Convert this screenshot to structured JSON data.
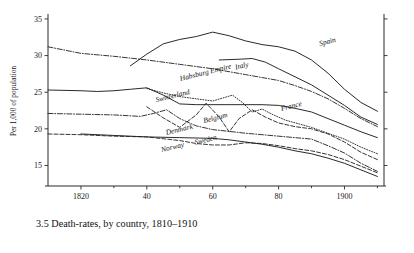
{
  "figure": {
    "caption": "3.5  Death-rates, by country, 1810–1910",
    "ylabel": "Per 1,000 of population"
  },
  "chart_data": {
    "type": "line",
    "title": "3.5  Death-rates, by country, 1810–1910",
    "xlabel": "",
    "ylabel": "Per 1,000 of population",
    "xlim": [
      1810,
      1912
    ],
    "ylim": [
      12.2,
      35.4
    ],
    "xticks": [
      1820,
      1840,
      1860,
      1880,
      1900
    ],
    "xticklabels": [
      "1820",
      "40",
      "60",
      "80",
      "1900"
    ],
    "xminorticks": [
      1830,
      1850,
      1870,
      1890,
      1910
    ],
    "yticks": [
      15,
      20,
      25,
      30,
      35
    ],
    "yticklabels": [
      "15",
      "20",
      "25",
      "30",
      "35"
    ],
    "grid": false,
    "legend_position": "inline-labels",
    "right_axis_ticks": true,
    "series": [
      {
        "name": "Spain",
        "style": "solid",
        "label_x": 1895,
        "label_y": 31.6,
        "points": [
          [
            1835,
            28.6
          ],
          [
            1840,
            30.2
          ],
          [
            1845,
            31.6
          ],
          [
            1850,
            32.2
          ],
          [
            1855,
            32.6
          ],
          [
            1860,
            33.2
          ],
          [
            1865,
            32.7
          ],
          [
            1870,
            32.0
          ],
          [
            1875,
            31.5
          ],
          [
            1880,
            31.2
          ],
          [
            1885,
            30.6
          ],
          [
            1890,
            29.4
          ],
          [
            1895,
            27.6
          ],
          [
            1900,
            25.4
          ],
          [
            1905,
            23.6
          ],
          [
            1910,
            22.4
          ]
        ]
      },
      {
        "name": "Italy",
        "style": "solid",
        "label_x": 1869,
        "label_y": 28.3,
        "points": [
          [
            1862,
            29.4
          ],
          [
            1868,
            29.5
          ],
          [
            1872,
            29.6
          ],
          [
            1876,
            29.1
          ],
          [
            1880,
            28.2
          ],
          [
            1885,
            27.1
          ],
          [
            1890,
            26.0
          ],
          [
            1895,
            24.6
          ],
          [
            1900,
            23.2
          ],
          [
            1905,
            21.6
          ],
          [
            1910,
            20.6
          ]
        ]
      },
      {
        "name": "Habsburg Empire",
        "style": "dashdot",
        "label_x": 1858,
        "label_y": 27.4,
        "points": [
          [
            1810,
            31.2
          ],
          [
            1820,
            30.3
          ],
          [
            1830,
            29.9
          ],
          [
            1840,
            29.4
          ],
          [
            1850,
            28.8
          ],
          [
            1860,
            28.2
          ],
          [
            1870,
            27.4
          ],
          [
            1880,
            26.6
          ],
          [
            1885,
            25.9
          ],
          [
            1890,
            25.1
          ],
          [
            1895,
            24.1
          ],
          [
            1900,
            22.8
          ],
          [
            1905,
            21.4
          ],
          [
            1910,
            20.3
          ]
        ]
      },
      {
        "name": "France",
        "style": "solid",
        "label_x": 1884,
        "label_y": 22.8,
        "points": [
          [
            1810,
            25.3
          ],
          [
            1820,
            25.2
          ],
          [
            1825,
            25.1
          ],
          [
            1830,
            25.2
          ],
          [
            1835,
            25.4
          ],
          [
            1840,
            25.6
          ],
          [
            1845,
            24.6
          ],
          [
            1850,
            23.4
          ],
          [
            1855,
            23.3
          ],
          [
            1865,
            23.3
          ],
          [
            1875,
            23.3
          ],
          [
            1880,
            23.2
          ],
          [
            1885,
            22.8
          ],
          [
            1890,
            22.3
          ],
          [
            1895,
            21.4
          ],
          [
            1900,
            20.5
          ],
          [
            1905,
            19.6
          ],
          [
            1910,
            18.8
          ]
        ]
      },
      {
        "name": "Switzerland",
        "style": "dotted",
        "label_x": 1848,
        "label_y": 24.2,
        "points": [
          [
            1840,
            25.5
          ],
          [
            1845,
            24.9
          ],
          [
            1850,
            24.4
          ],
          [
            1855,
            24.1
          ],
          [
            1860,
            23.8
          ],
          [
            1863,
            24.2
          ],
          [
            1866,
            24.6
          ],
          [
            1869,
            23.6
          ],
          [
            1872,
            22.3
          ],
          [
            1875,
            22.7
          ],
          [
            1878,
            22.0
          ],
          [
            1882,
            21.2
          ],
          [
            1886,
            20.7
          ],
          [
            1890,
            20.2
          ],
          [
            1895,
            19.4
          ],
          [
            1900,
            18.6
          ],
          [
            1905,
            17.5
          ],
          [
            1910,
            16.6
          ]
        ]
      },
      {
        "name": "Belgium",
        "style": "dashed",
        "label_x": 1861,
        "label_y": 21.2,
        "points": [
          [
            1840,
            23.0
          ],
          [
            1845,
            21.5
          ],
          [
            1850,
            20.2
          ],
          [
            1855,
            21.9
          ],
          [
            1858,
            23.5
          ],
          [
            1862,
            21.6
          ],
          [
            1865,
            19.6
          ],
          [
            1868,
            21.4
          ],
          [
            1872,
            22.6
          ],
          [
            1876,
            21.6
          ],
          [
            1880,
            20.8
          ],
          [
            1885,
            20.3
          ],
          [
            1890,
            20.0
          ],
          [
            1895,
            19.3
          ],
          [
            1900,
            18.2
          ],
          [
            1905,
            16.8
          ],
          [
            1910,
            15.8
          ]
        ]
      },
      {
        "name": "Denmark",
        "style": "dashdot",
        "label_x": 1850,
        "label_y": 19.6,
        "points": [
          [
            1810,
            22.1
          ],
          [
            1820,
            22.0
          ],
          [
            1830,
            21.9
          ],
          [
            1838,
            21.7
          ],
          [
            1842,
            22.1
          ],
          [
            1846,
            22.6
          ],
          [
            1850,
            21.4
          ],
          [
            1855,
            20.4
          ],
          [
            1860,
            19.9
          ],
          [
            1870,
            19.4
          ],
          [
            1880,
            19.0
          ],
          [
            1885,
            18.8
          ],
          [
            1890,
            18.6
          ],
          [
            1895,
            17.7
          ],
          [
            1900,
            16.7
          ],
          [
            1905,
            15.3
          ],
          [
            1910,
            14.2
          ]
        ]
      },
      {
        "name": "Sweden",
        "style": "dashed",
        "label_x": 1858,
        "label_y": 18.2,
        "points": [
          [
            1810,
            19.3
          ],
          [
            1820,
            19.2
          ],
          [
            1830,
            19.0
          ],
          [
            1840,
            18.9
          ],
          [
            1850,
            18.4
          ],
          [
            1855,
            18.0
          ],
          [
            1860,
            17.8
          ],
          [
            1865,
            17.8
          ],
          [
            1870,
            18.1
          ],
          [
            1875,
            18.0
          ],
          [
            1880,
            17.7
          ],
          [
            1885,
            17.3
          ],
          [
            1890,
            17.0
          ],
          [
            1895,
            16.5
          ],
          [
            1900,
            15.8
          ],
          [
            1905,
            14.9
          ],
          [
            1910,
            14.0
          ]
        ]
      },
      {
        "name": "Norway",
        "style": "solid",
        "label_x": 1848,
        "label_y": 17.2,
        "points": [
          [
            1820,
            19.3
          ],
          [
            1830,
            19.1
          ],
          [
            1840,
            18.9
          ],
          [
            1850,
            18.8
          ],
          [
            1860,
            18.7
          ],
          [
            1865,
            18.5
          ],
          [
            1870,
            18.2
          ],
          [
            1875,
            17.9
          ],
          [
            1880,
            17.5
          ],
          [
            1885,
            17.0
          ],
          [
            1890,
            16.6
          ],
          [
            1895,
            16.0
          ],
          [
            1900,
            15.3
          ],
          [
            1905,
            14.4
          ],
          [
            1910,
            13.5
          ]
        ]
      }
    ]
  }
}
